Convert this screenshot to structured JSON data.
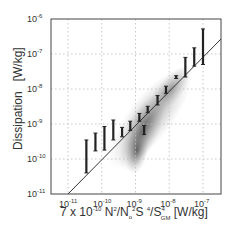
{
  "chart_data": {
    "type": "scatter",
    "title": "",
    "xlabel": "7 x 10^-10 N^2/N0^2 S^4/S_GM^4 [W/kg]",
    "ylabel": "Dissipation   [W/kg]",
    "xscale": "log",
    "yscale": "log",
    "xlim": [
      3e-12,
      3e-07
    ],
    "ylim": [
      1e-11,
      1e-06
    ],
    "grid": true,
    "x_ticks": [
      "10^-11",
      "10^-10",
      "10^-9",
      "10^-8",
      "10^-7"
    ],
    "y_ticks": [
      "10^-11",
      "10^-10",
      "10^-9",
      "10^-8",
      "10^-7",
      "10^-6"
    ],
    "reference_line": {
      "slope": 1,
      "description": "1:1 line",
      "from": [
        1e-11,
        1e-11
      ],
      "to": [
        3e-07,
        3e-07
      ]
    },
    "density_cloud": {
      "description": "grey 2D histogram of observations",
      "center_x": 2e-09,
      "center_y": 5e-10
    },
    "series": [
      {
        "name": "binned range (error bars)",
        "x": [
          3.5e-11,
          6.5e-11,
          1.2e-10,
          2.2e-10,
          4e-10,
          7e-10,
          1.3e-09,
          2.3e-09,
          1.8e-09,
          4.5e-09,
          8e-09,
          1.6e-08,
          3e-08,
          5.5e-08,
          1e-07
        ],
        "lower": [
          4e-11,
          1.7e-10,
          1.8e-10,
          3.5e-10,
          4.3e-10,
          6.5e-10,
          1.2e-09,
          2.1e-09,
          5e-10,
          3.5e-09,
          7.5e-09,
          2e-08,
          2.2e-08,
          4.5e-08,
          5e-08
        ],
        "upper": [
          3.5e-10,
          5.5e-10,
          8.5e-10,
          1.3e-09,
          8e-10,
          1.2e-09,
          2e-09,
          3.2e-09,
          9e-10,
          6.5e-09,
          1.2e-08,
          2.4e-08,
          8e-08,
          1.5e-07,
          5.2e-07
        ]
      }
    ]
  },
  "axes": {
    "ylabel": "Dissipation   [W/kg]",
    "xlabel_parts": {
      "prefix": "7 x 10",
      "exp1": "-10",
      "n": " N",
      "exp2": "2",
      "slash_n0": "/N",
      "sub0": "o",
      "exp3": "2",
      "s": "S ",
      "exp4": "4",
      "slash_s": "/S",
      "exp5": "4",
      "subgm": "GM",
      "unit": " [W/kg]"
    },
    "xticks": [
      {
        "base": "10",
        "exp": "-11"
      },
      {
        "base": "10",
        "exp": "-10"
      },
      {
        "base": "10",
        "exp": "-9"
      },
      {
        "base": "10",
        "exp": "-8"
      },
      {
        "base": "10",
        "exp": "-7"
      }
    ],
    "yticks": [
      {
        "base": "10",
        "exp": "-6"
      },
      {
        "base": "10",
        "exp": "-7"
      },
      {
        "base": "10",
        "exp": "-8"
      },
      {
        "base": "10",
        "exp": "-9"
      },
      {
        "base": "10",
        "exp": "-10"
      },
      {
        "base": "10",
        "exp": "-11"
      }
    ]
  },
  "colors": {
    "axis": "#444444",
    "grid": "#bbbbbb",
    "errorbar": "#222222",
    "line": "#333333",
    "cloud": "#555555"
  }
}
